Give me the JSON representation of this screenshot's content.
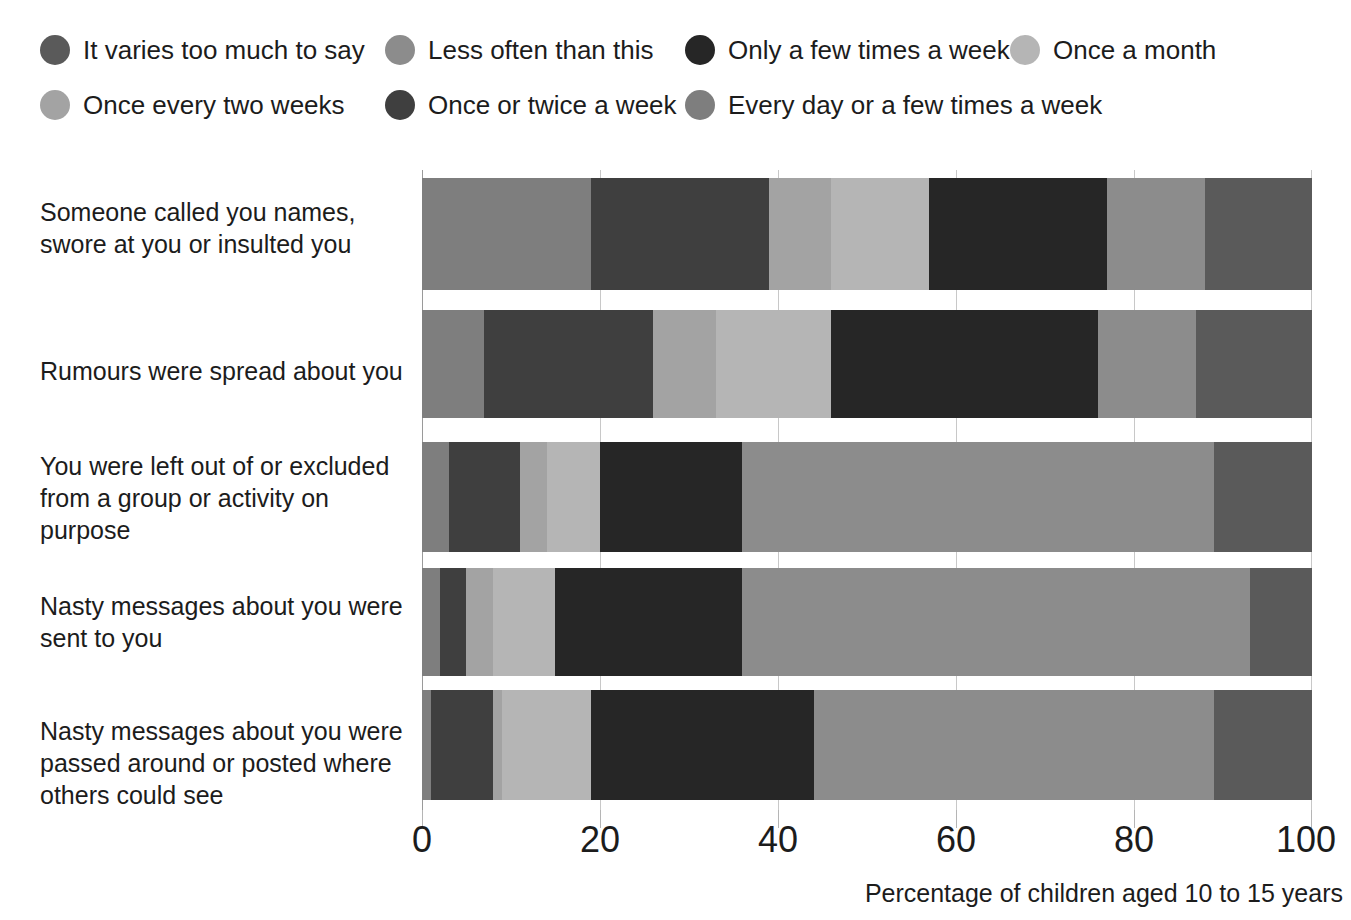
{
  "legend": {
    "rows": [
      [
        {
          "label": "It varies too much to say",
          "color": "#5a5a5a"
        },
        {
          "label": "Less often than this",
          "color": "#8c8c8c"
        },
        {
          "label": "Only a few times a week",
          "color": "#262626"
        },
        {
          "label": "Once a month",
          "color": "#b5b5b5"
        }
      ],
      [
        {
          "label": "Once every two weeks",
          "color": "#a3a3a3"
        },
        {
          "label": "Once or twice a week",
          "color": "#3f3f3f"
        },
        {
          "label": "Every day or a few times a week",
          "color": "#7e7e7e"
        }
      ]
    ]
  },
  "axis": {
    "xticks": [
      "0",
      "20",
      "40",
      "60",
      "80",
      "100"
    ],
    "xtitle": "Percentage of children aged 10 to 15 years"
  },
  "chart_data": {
    "type": "bar",
    "orientation": "horizontal",
    "stacked": true,
    "title": "",
    "xlabel": "Percentage of children aged 10 to 15 years",
    "ylabel": "",
    "xlim": [
      0,
      100
    ],
    "xticks": [
      0,
      20,
      40,
      60,
      80,
      100
    ],
    "grid": true,
    "legend_position": "top",
    "categories": [
      "Someone called you names, swore at you or insulted you",
      "Rumours were spread about you",
      "You were left out of or excluded from a group or activity on purpose",
      "Nasty messages about you were sent to you",
      "Nasty messages about you were passed around or posted where others could see"
    ],
    "series": [
      {
        "name": "Every day or a few times a week",
        "color": "#7e7e7e",
        "values": [
          19,
          7,
          3,
          2,
          1
        ]
      },
      {
        "name": "Once or twice a week",
        "color": "#3f3f3f",
        "values": [
          20,
          19,
          8,
          3,
          7
        ]
      },
      {
        "name": "Once every two weeks",
        "color": "#a3a3a3",
        "values": [
          7,
          7,
          3,
          3,
          1
        ]
      },
      {
        "name": "Once a month",
        "color": "#b5b5b5",
        "values": [
          11,
          13,
          6,
          7,
          10
        ]
      },
      {
        "name": "Only a few times a week",
        "color": "#262626",
        "values": [
          20,
          30,
          16,
          21,
          25
        ]
      },
      {
        "name": "Less often than this",
        "color": "#8c8c8c",
        "values": [
          11,
          11,
          53,
          57,
          45
        ]
      },
      {
        "name": "It varies too much to say",
        "color": "#5a5a5a",
        "values": [
          12,
          13,
          11,
          7,
          11
        ]
      }
    ]
  }
}
